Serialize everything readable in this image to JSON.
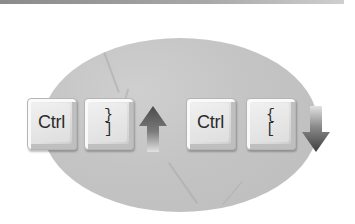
{
  "illustration": {
    "description": "Keyboard shortcut illustration",
    "shortcuts": [
      {
        "keys": [
          {
            "label": "Ctrl"
          },
          {
            "top": "}",
            "bottom": "]"
          }
        ],
        "direction": "up",
        "icon": "arrow-up-icon"
      },
      {
        "keys": [
          {
            "label": "Ctrl"
          },
          {
            "top": "{",
            "bottom": "["
          }
        ],
        "direction": "down",
        "icon": "arrow-down-icon"
      }
    ]
  },
  "colors": {
    "backdrop": "#c4c4c4",
    "key_face": "#e6e6e6",
    "arrow_dark": "#555555",
    "arrow_light": "#d8d8d8",
    "top_bar": "#9a9a9a"
  }
}
